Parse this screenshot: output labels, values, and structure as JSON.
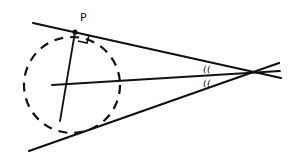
{
  "diagram": {
    "labels": {
      "point_p": "P",
      "angle_mark_upper": "((",
      "angle_mark_lower": "(("
    },
    "colors": {
      "stroke": "#111111",
      "background": "#ffffff"
    },
    "circle": {
      "cx": 72,
      "cy": 85,
      "r": 48,
      "style": "dashed"
    },
    "lines": {
      "upper_tangent": {
        "x1": 33,
        "y1": 23,
        "x2": 281,
        "y2": 78
      },
      "lower_tangent": {
        "x1": 29,
        "y1": 151,
        "x2": 279,
        "y2": 63
      },
      "bisector": {
        "x1": 52,
        "y1": 85,
        "x2": 280,
        "y2": 71
      },
      "radius_to_p": {
        "x1": 75,
        "y1": 32,
        "x2": 60,
        "y2": 121
      }
    },
    "point_p": {
      "x": 75,
      "y": 32
    },
    "vertex": {
      "x": 255,
      "y": 70
    }
  }
}
